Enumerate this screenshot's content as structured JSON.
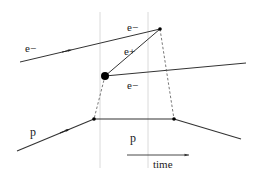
{
  "diagram": {
    "labels": {
      "incoming_electron": "e−",
      "outgoing_electron_top": "e−",
      "positron": "e+",
      "outgoing_electron_bottom": "e−",
      "incoming_proton": "p",
      "intermediate_proton": "p",
      "time_axis": "time"
    },
    "colors": {
      "line": "#333333",
      "guide": "#cccccc",
      "dashed": "#555555",
      "vertex": "#000000"
    }
  }
}
